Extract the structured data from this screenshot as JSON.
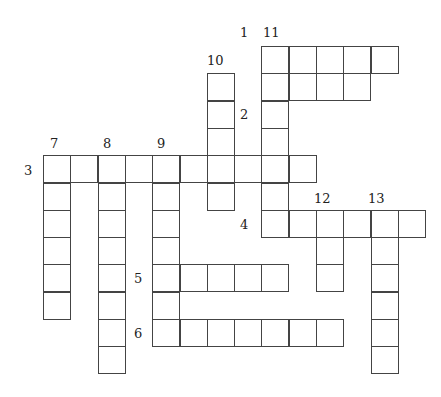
{
  "puzzle": {
    "type": "crossword",
    "cell_size": 27.3,
    "origin": {
      "x": 43,
      "y": 46
    },
    "colors": {
      "line": "#444444",
      "background": "#ffffff",
      "text": "#222222"
    },
    "entries": [
      {
        "number": "1",
        "direction": "across",
        "row": 0,
        "col": 8,
        "length": 5
      },
      {
        "number": "2",
        "direction": "across",
        "row": 1,
        "col": 8,
        "length": 4
      },
      {
        "number": "3",
        "direction": "across",
        "row": 4,
        "col": 0,
        "length": 10
      },
      {
        "number": "4",
        "direction": "across",
        "row": 6,
        "col": 8,
        "length": 6
      },
      {
        "number": "5",
        "direction": "across",
        "row": 8,
        "col": 4,
        "length": 5
      },
      {
        "number": "6",
        "direction": "across",
        "row": 10,
        "col": 4,
        "length": 7
      },
      {
        "number": "7",
        "direction": "down",
        "row": 4,
        "col": 0,
        "length": 6
      },
      {
        "number": "8",
        "direction": "down",
        "row": 4,
        "col": 2,
        "length": 8
      },
      {
        "number": "9",
        "direction": "down",
        "row": 4,
        "col": 4,
        "length": 7
      },
      {
        "number": "10",
        "direction": "down",
        "row": 1,
        "col": 6,
        "length": 5
      },
      {
        "number": "11",
        "direction": "down",
        "row": 0,
        "col": 8,
        "length": 7
      },
      {
        "number": "12",
        "direction": "down",
        "row": 6,
        "col": 10,
        "length": 3
      },
      {
        "number": "13",
        "direction": "down",
        "row": 6,
        "col": 12,
        "length": 6
      }
    ],
    "labels": [
      {
        "text": "1",
        "x": 240,
        "y": 26
      },
      {
        "text": "2",
        "x": 240,
        "y": 108
      },
      {
        "text": "3",
        "x": 24,
        "y": 164
      },
      {
        "text": "4",
        "x": 240,
        "y": 218
      },
      {
        "text": "5",
        "x": 134,
        "y": 272
      },
      {
        "text": "6",
        "x": 134,
        "y": 327
      },
      {
        "text": "7",
        "x": 50,
        "y": 137
      },
      {
        "text": "8",
        "x": 103,
        "y": 137
      },
      {
        "text": "9",
        "x": 157,
        "y": 137
      },
      {
        "text": "10",
        "x": 207,
        "y": 54
      },
      {
        "text": "11",
        "x": 263,
        "y": 26
      },
      {
        "text": "12",
        "x": 314,
        "y": 192
      },
      {
        "text": "13",
        "x": 368,
        "y": 192
      }
    ]
  }
}
